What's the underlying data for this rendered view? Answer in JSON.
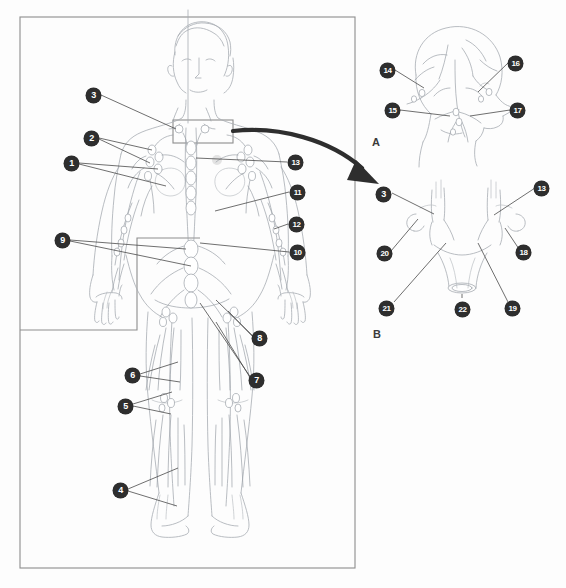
{
  "figure": {
    "background_color": "#fdfdfd",
    "marker_fill": "#2e2e2e",
    "marker_text_color": "#ffffff",
    "line_art_color": "#9aa0a6",
    "leader_line_color": "#4a4a4a",
    "frame_color": "#8d8d8d"
  },
  "panels": [
    {
      "id": "main",
      "label": "",
      "caption": ""
    },
    {
      "id": "A",
      "label": "A",
      "caption": ""
    },
    {
      "id": "B",
      "label": "B",
      "caption": ""
    }
  ],
  "main_panel": {
    "frame": {
      "x": 20,
      "y": 17,
      "width": 335,
      "height": 551
    },
    "inset_frame": {
      "x": 137,
      "y": 238,
      "width": 63,
      "height": 92
    },
    "inset_frame_left": {
      "x": 20,
      "y": 238,
      "width": 117,
      "height": 92
    },
    "callout_box": {
      "x": 173,
      "y": 120,
      "width": 60,
      "height": 23
    },
    "markers": [
      {
        "id": "1",
        "x": 64,
        "y": 156
      },
      {
        "id": "2",
        "x": 84,
        "y": 131
      },
      {
        "id": "3",
        "x": 86,
        "y": 88
      },
      {
        "id": "4",
        "x": 113,
        "y": 483
      },
      {
        "id": "5",
        "x": 118,
        "y": 399
      },
      {
        "id": "6",
        "x": 125,
        "y": 368
      },
      {
        "id": "7",
        "x": 249,
        "y": 373
      },
      {
        "id": "8",
        "x": 252,
        "y": 331
      },
      {
        "id": "9",
        "x": 55,
        "y": 233
      },
      {
        "id": "10",
        "x": 290,
        "y": 245
      },
      {
        "id": "11",
        "x": 290,
        "y": 185
      },
      {
        "id": "12",
        "x": 289,
        "y": 217
      },
      {
        "id": "13",
        "x": 288,
        "y": 155
      }
    ]
  },
  "panel_a": {
    "label": "A",
    "label_pos": {
      "x": 372,
      "y": 136
    },
    "markers": [
      {
        "id": "14",
        "x": 380,
        "y": 63
      },
      {
        "id": "15",
        "x": 385,
        "y": 103
      },
      {
        "id": "16",
        "x": 508,
        "y": 56
      },
      {
        "id": "17",
        "x": 510,
        "y": 103
      }
    ]
  },
  "panel_b": {
    "label": "B",
    "label_pos": {
      "x": 373,
      "y": 328
    },
    "markers": [
      {
        "id": "3",
        "x": 376,
        "y": 187
      },
      {
        "id": "13",
        "x": 534,
        "y": 181
      },
      {
        "id": "18",
        "x": 516,
        "y": 245
      },
      {
        "id": "19",
        "x": 505,
        "y": 301
      },
      {
        "id": "20",
        "x": 377,
        "y": 246
      },
      {
        "id": "21",
        "x": 379,
        "y": 301
      },
      {
        "id": "22",
        "x": 455,
        "y": 302
      }
    ]
  },
  "arrow": {
    "name": "curved-pointer-arrow",
    "from": {
      "x": 233,
      "y": 131
    },
    "to": {
      "x": 379,
      "y": 183
    },
    "color": "#2e2e2e"
  }
}
